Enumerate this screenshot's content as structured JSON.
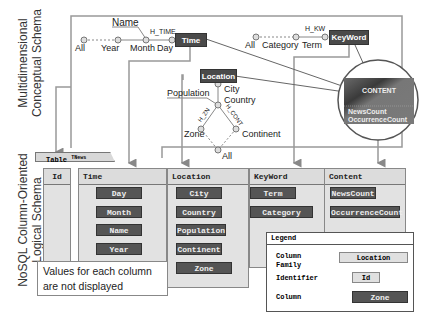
{
  "labels": {
    "conceptual": [
      "Multidimensional",
      "Conceptual Schema"
    ],
    "logical": [
      "NoSQL Column-Oriented",
      "Logical Schema"
    ]
  },
  "conceptual": {
    "time": {
      "name": "Time",
      "hierarchy": "H_TIME",
      "levels": [
        "Day",
        "Month",
        "Year",
        "All"
      ],
      "attribute": "Name"
    },
    "keyword": {
      "name": "KeyWord",
      "hierarchy": "H_KW",
      "levels": [
        "Term",
        "Category",
        "All"
      ]
    },
    "location": {
      "name": "Location",
      "levels": [
        "City",
        "Country",
        "Zone",
        "Continent",
        "All"
      ],
      "attribute": "Population",
      "hierarchies": [
        "H_ZN",
        "H_CONT"
      ]
    },
    "fact": {
      "name": "CONTENT",
      "measures": [
        "NewsCount",
        "OccurrenceCount"
      ]
    }
  },
  "logical": {
    "table_name": "Table",
    "table_superscript": "TNews",
    "id_family": "Id",
    "families": [
      {
        "name": "Time",
        "columns": [
          "Day",
          "Month",
          "Name",
          "Year"
        ]
      },
      {
        "name": "Location",
        "columns": [
          "City",
          "Country",
          "Population",
          "Continent",
          "Zone"
        ]
      },
      {
        "name": "KeyWord",
        "columns": [
          "Term",
          "Category"
        ]
      },
      {
        "name": "Content",
        "columns": [
          "NewsCount",
          "OccurrenceCount"
        ]
      }
    ]
  },
  "note": [
    "Values for each column",
    "are not displayed"
  ],
  "legend": {
    "title": "Legend",
    "items": [
      {
        "label1": "Column",
        "label2": "Family",
        "sample": "Location"
      },
      {
        "label1": "Identifier",
        "sample": "Id"
      },
      {
        "label1": "Column",
        "sample": "Zone"
      }
    ]
  }
}
